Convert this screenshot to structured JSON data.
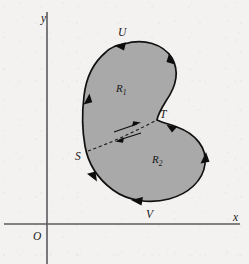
{
  "figure": {
    "background_color": "#f3f2f0",
    "region_fill_color": "#a9a9a9",
    "outline_color": "#111111",
    "axis_color": "#5b5b5f"
  },
  "axes": {
    "x_label": "x",
    "y_label": "y",
    "origin_label": "O"
  },
  "boundary_points": {
    "U": "U",
    "V": "V",
    "S": "S",
    "T": "T"
  },
  "regions": [
    {
      "name": "R",
      "subscript": "1",
      "position": "upper-left lobe"
    },
    {
      "name": "R",
      "subscript": "2",
      "position": "lower-right lobe"
    }
  ],
  "cut": {
    "from": "S",
    "to": "T",
    "style": "dashed",
    "arrow_count": 2,
    "arrow_directions": [
      "toward-T",
      "toward-S"
    ]
  },
  "orientation": {
    "direction": "counterclockwise",
    "arrow_count": 7
  }
}
